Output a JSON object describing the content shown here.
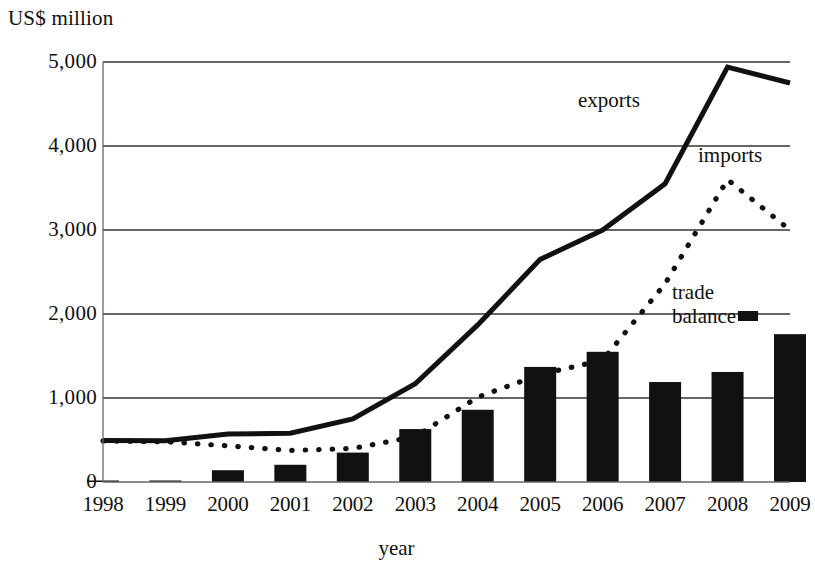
{
  "chart_data": {
    "type": "line",
    "title": "",
    "xlabel": "year",
    "ylabel": "US$ million",
    "categories": [
      "1998",
      "1999",
      "2000",
      "2001",
      "2002",
      "2003",
      "2004",
      "2005",
      "2006",
      "2007",
      "2008",
      "2009"
    ],
    "x": [
      1998,
      1999,
      2000,
      2001,
      2002,
      2003,
      2004,
      2005,
      2006,
      2007,
      2008,
      2009
    ],
    "ylim": [
      0,
      5000
    ],
    "xlim": [
      1998,
      2009
    ],
    "yticks": [
      0,
      1000,
      2000,
      3000,
      4000,
      5000
    ],
    "ytick_labels": [
      "0",
      "1,000",
      "2,000",
      "3,000",
      "4,000",
      "5,000"
    ],
    "grid": "horizontal",
    "legend_position": "inline-annotations",
    "series": [
      {
        "name": "exports",
        "style": "solid-line",
        "color": "#111111",
        "values": [
          495,
          490,
          570,
          580,
          750,
          1170,
          1870,
          2650,
          3000,
          3550,
          4940,
          4750
        ]
      },
      {
        "name": "imports",
        "style": "dotted-line",
        "color": "#111111",
        "values": [
          490,
          480,
          430,
          375,
          400,
          540,
          1010,
          1280,
          1450,
          2360,
          3600,
          3000
        ]
      },
      {
        "name": "trade balance",
        "style": "bar",
        "color": "#111111",
        "values": [
          0,
          10,
          140,
          205,
          350,
          630,
          860,
          1370,
          1550,
          1190,
          1310,
          1760
        ]
      }
    ],
    "annotations": [
      {
        "text": "exports",
        "series": "exports"
      },
      {
        "text": "imports",
        "series": "imports"
      },
      {
        "text": "trade",
        "series": "trade balance"
      },
      {
        "text": "balance",
        "series": "trade balance"
      }
    ]
  },
  "axes": {
    "y_axis_title": "US$ million",
    "x_axis_title": "year"
  },
  "labels": {
    "exports": "exports",
    "imports": "imports",
    "trade_line1": "trade",
    "trade_line2": "balance"
  }
}
